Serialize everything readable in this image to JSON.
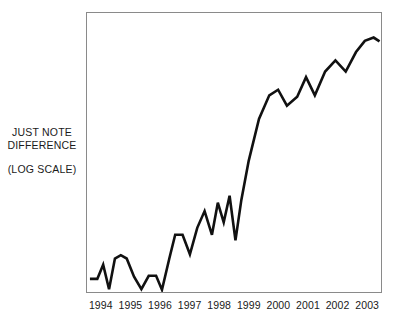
{
  "chart_data": {
    "type": "line",
    "title": "",
    "subtitle": "",
    "xlabel": "",
    "ylabel": "JUST NOTE DIFFERENCE",
    "ylabel_note": "(LOG SCALE)",
    "y_axis_ticks": [],
    "y_axis_scale": "log",
    "grid": false,
    "legend": null,
    "annotations": [
      "JUST NOTE",
      "DIFFERENCE",
      "(LOG SCALE)"
    ],
    "categories": [
      "1994",
      "1995",
      "1996",
      "1997",
      "1998",
      "1999",
      "2000",
      "2001",
      "2002",
      "2003"
    ],
    "xlim": [
      1993.6,
      2003.6
    ],
    "ylim": [
      0,
      1
    ],
    "series": [
      {
        "name": "index",
        "line_color": "#111111",
        "line_width": 2.6,
        "x": [
          1993.7,
          1993.95,
          1994.15,
          1994.35,
          1994.55,
          1994.75,
          1994.95,
          1995.2,
          1995.45,
          1995.7,
          1995.95,
          1996.15,
          1996.4,
          1996.6,
          1996.85,
          1997.1,
          1997.35,
          1997.6,
          1997.85,
          1998.05,
          1998.25,
          1998.45,
          1998.65,
          1998.85,
          1999.1,
          1999.45,
          1999.8,
          2000.1,
          2000.4,
          2000.75,
          2001.05,
          2001.35,
          2001.7,
          2002.05,
          2002.4,
          2002.75,
          2003.05,
          2003.35,
          2003.55
        ],
        "y": [
          0.047,
          0.047,
          0.098,
          0.01,
          0.12,
          0.132,
          0.12,
          0.055,
          0.01,
          0.058,
          0.058,
          0.008,
          0.12,
          0.205,
          0.205,
          0.135,
          0.23,
          0.29,
          0.205,
          0.32,
          0.25,
          0.345,
          0.185,
          0.33,
          0.47,
          0.62,
          0.705,
          0.725,
          0.668,
          0.7,
          0.77,
          0.705,
          0.79,
          0.83,
          0.79,
          0.86,
          0.9,
          0.912,
          0.898
        ]
      }
    ]
  }
}
